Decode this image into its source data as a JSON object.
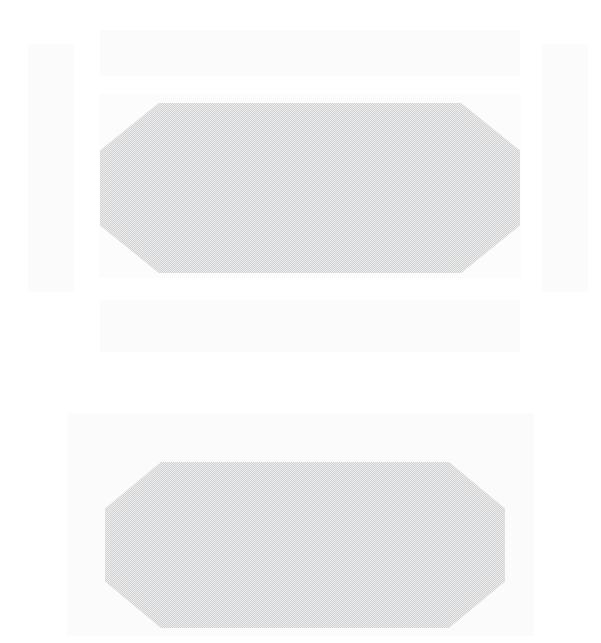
{
  "document": {
    "title": "Faded scanned page",
    "page_background": "#ffffff",
    "appearance": "washed-out low-contrast scan, no legible text",
    "canvas": {
      "width": 601,
      "height": 643
    }
  },
  "palette": {
    "page": "#ffffff",
    "wash": "#fbfbfc",
    "wash_soft": "#fcfcfd",
    "shape_fill": "#d2d3d4",
    "shape_fill_light": "#dcdddd"
  },
  "groups": [
    {
      "name": "upper-group",
      "label": "Upper block group",
      "regions": [
        {
          "name": "top-band",
          "label": "Top faint band",
          "fill": "#fbfbfc",
          "x": 100,
          "y": 30,
          "width": 420,
          "height": 46,
          "shape": "rectangle"
        },
        {
          "name": "left-side-block",
          "label": "Left side faint block",
          "fill": "#fbfbfc",
          "x": 28,
          "y": 44,
          "width": 46,
          "height": 248,
          "shape": "rectangle"
        },
        {
          "name": "right-side-block",
          "label": "Right side faint block",
          "fill": "#fbfbfc",
          "x": 542,
          "y": 44,
          "width": 46,
          "height": 248,
          "shape": "rectangle"
        },
        {
          "name": "middle-band",
          "label": "Middle faint band",
          "fill": "#fcfcfd",
          "x": 99,
          "y": 94,
          "width": 422,
          "height": 184,
          "shape": "rectangle"
        },
        {
          "name": "primary-octagon",
          "label": "Primary chamfered shape",
          "fill": "#d2d3d4",
          "x": 100,
          "y": 103,
          "width": 420,
          "height": 170,
          "shape": "octagon",
          "texture": "fine dither / halftone weave"
        },
        {
          "name": "bottom-band",
          "label": "Bottom faint band",
          "fill": "#fbfbfc",
          "x": 100,
          "y": 300,
          "width": 420,
          "height": 52,
          "shape": "rectangle"
        }
      ]
    },
    {
      "name": "lower-group",
      "label": "Lower block group",
      "regions": [
        {
          "name": "lower-backing-panel",
          "label": "Lower faint backing panel",
          "fill": "#fbfbfc",
          "x": 67,
          "y": 413,
          "width": 467,
          "height": 223,
          "shape": "rectangle"
        },
        {
          "name": "secondary-octagon",
          "label": "Secondary chamfered shape",
          "fill": "#d2d3d4",
          "x": 105,
          "y": 462,
          "width": 400,
          "height": 166,
          "shape": "octagon",
          "texture": "fine dither / halftone weave"
        }
      ]
    }
  ]
}
